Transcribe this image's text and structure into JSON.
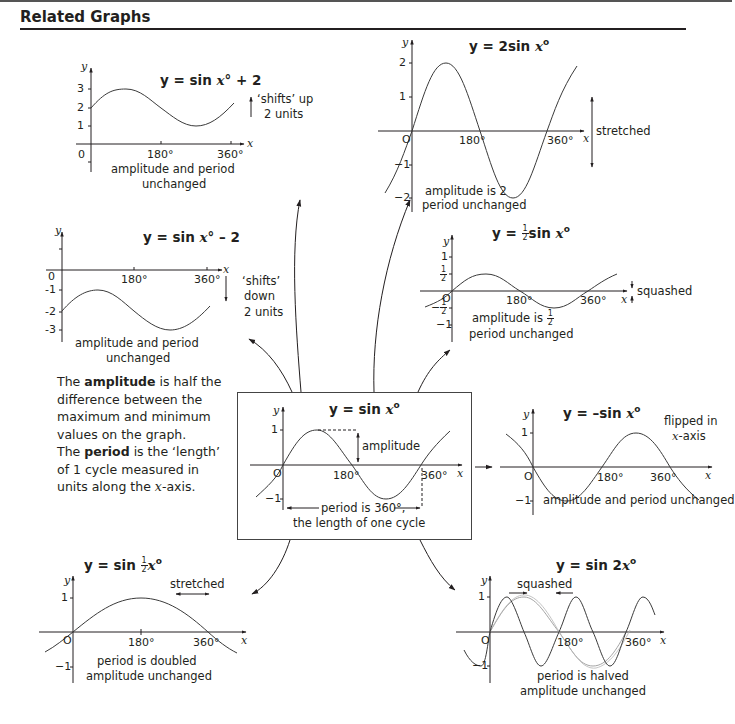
{
  "header": {
    "title": "Related Graphs"
  },
  "explanation": {
    "amplitude_prefix": "The ",
    "amplitude_term": "amplitude",
    "amplitude_text": " is half the difference between the maximum and minimum values on the graph.",
    "period_prefix": "The ",
    "period_term": "period",
    "period_text": " is the ‘length’ of 1 cycle measured in units along the ",
    "period_axis": "x",
    "period_suffix": "-axis."
  },
  "graphs": {
    "shift_up": {
      "equation_prefix": "y = sin ",
      "equation_var": "x",
      "equation_suffix": "° + 2",
      "y_label": "y",
      "x_label": "x",
      "y_ticks": [
        "3",
        "2",
        "1"
      ],
      "origin": "0",
      "x_ticks": [
        "180°",
        "360°"
      ],
      "note": "‘shifts’ up",
      "note2": "2 units",
      "caption1": "amplitude and period",
      "caption2": "unchanged"
    },
    "stretch_vertical": {
      "equation_prefix": "y = 2sin ",
      "equation_var": "x",
      "equation_suffix": "o",
      "y_label": "y",
      "x_label": "x",
      "y_ticks": [
        "2",
        "1",
        "−1",
        "−2"
      ],
      "origin": "O",
      "x_ticks": [
        "180°",
        "360°"
      ],
      "note": "stretched",
      "caption1": "amplitude is 2",
      "caption2": "period unchanged"
    },
    "shift_down": {
      "equation_prefix": "y = sin ",
      "equation_var": "x",
      "equation_suffix": "° – 2",
      "y_label": "y",
      "x_label": "x",
      "y_ticks": [
        "-1",
        "-2",
        "-3"
      ],
      "origin": "0",
      "x_ticks": [
        "180°",
        "360°"
      ],
      "note": "‘shifts’",
      "note2": "down",
      "note3": "2 units",
      "caption1": "amplitude and period",
      "caption2": "unchanged"
    },
    "squash_vertical": {
      "equation_prefix": "y = ",
      "equation_frac_num": "1",
      "equation_frac_den": "2",
      "equation_mid": "sin ",
      "equation_var": "x",
      "equation_suffix": "o",
      "y_label": "y",
      "x_label": "x",
      "y_ticks": [
        "1",
        "1/2",
        "−1/2",
        "−1"
      ],
      "origin": "O",
      "x_ticks": [
        "180°",
        "360°"
      ],
      "note": "squashed",
      "caption1": "amplitude is ",
      "caption1_frac_num": "1",
      "caption1_frac_den": "2",
      "caption2": "period unchanged"
    },
    "base": {
      "equation_prefix": "y = sin ",
      "equation_var": "x",
      "equation_suffix": "o",
      "y_label": "y",
      "x_label": "x",
      "y_ticks": [
        "1",
        "−1"
      ],
      "origin": "O",
      "x_ticks": [
        "180°",
        "360°"
      ],
      "amplitude_label": "amplitude",
      "period_label1": "period is 360°,",
      "period_label2": "the length of one cycle"
    },
    "reflect": {
      "equation_prefix": "y = –sin ",
      "equation_var": "x",
      "equation_suffix": "o",
      "y_label": "y",
      "x_label": "x",
      "y_ticks": [
        "1",
        "−1"
      ],
      "origin": "O",
      "x_ticks": [
        "180°",
        "360°"
      ],
      "note": "flipped in",
      "note2_var": "x",
      "note2_suffix": "-axis",
      "caption1": "amplitude and period unchanged"
    },
    "stretch_horizontal": {
      "equation_prefix": "y = sin ",
      "equation_frac_num": "1",
      "equation_frac_den": "2",
      "equation_var": "x",
      "equation_suffix": "o",
      "y_label": "y",
      "x_label": "x",
      "y_ticks": [
        "1",
        "−1"
      ],
      "origin": "O",
      "x_ticks": [
        "180°",
        "360°"
      ],
      "note": "stretched",
      "caption1": "period is doubled",
      "caption2": "amplitude unchanged"
    },
    "squash_horizontal": {
      "equation_prefix": "y = sin 2",
      "equation_var": "x",
      "equation_suffix": "o",
      "y_label": "y",
      "x_label": "x",
      "y_ticks": [
        "1",
        "−1"
      ],
      "origin": "O",
      "x_ticks": [
        "180°",
        "360°"
      ],
      "note": "squashed",
      "caption1": "period is halved",
      "caption2": "amplitude unchanged"
    }
  },
  "colors": {
    "ink": "#231f20",
    "curve": "#3a3a3a",
    "background": "#ffffff"
  }
}
